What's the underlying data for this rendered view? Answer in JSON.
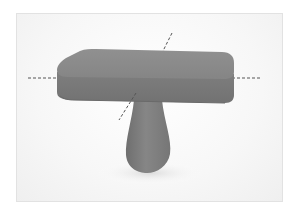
{
  "scene": {
    "description": "3D rendered mushroom-shaped object: rounded square slab top on a teardrop stem, with dashed axis lines",
    "colors": {
      "top_face": "#8a8a8a",
      "side_face": "#7a7a7a",
      "stem": "#7d7d7d",
      "axis_dash": "#555555",
      "frame_border": "#e2e2e2",
      "background": "#f7f7f7"
    },
    "axes": [
      {
        "name": "horizontal-axis"
      },
      {
        "name": "depth-axis"
      }
    ]
  }
}
